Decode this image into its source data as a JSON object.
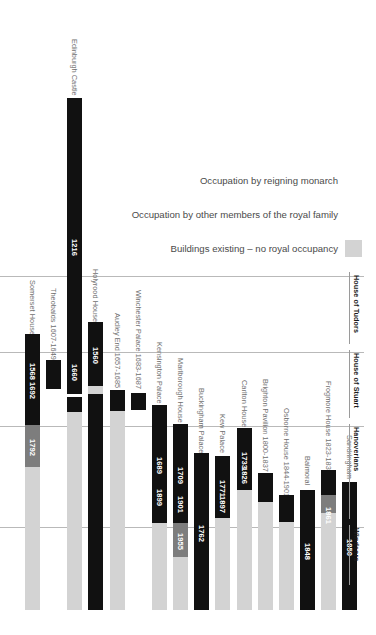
{
  "chart_data": {
    "type": "bar",
    "title": "",
    "orientation": "vertical-timeline",
    "xlabel": "",
    "ylabel": "",
    "legend_position": "top-right",
    "grid": true,
    "colors": {
      "monarch": "#111111",
      "family": "#7d7d7d",
      "none": "#d3d3d3"
    },
    "legend": [
      {
        "label": "Occupation by reigning monarch",
        "key": "monarch",
        "color": "#111111"
      },
      {
        "label": "Occupation by other members of the royal family",
        "key": "family",
        "color": "#7d7d7d"
      },
      {
        "label": "Buildings existing – no royal occupancy",
        "key": "none",
        "color": "#d3d3d3"
      }
    ],
    "eras": [
      {
        "label": "House of Tudors",
        "top": 272
      },
      {
        "label": "House of Stuart",
        "top": 350
      },
      {
        "label": "Hanoverians",
        "top": 424
      },
      {
        "label": "Windsors",
        "top": 525
      }
    ],
    "gridlines": [
      276,
      352,
      426,
      527
    ],
    "categories": [
      "Somerset House",
      "Theobalds 1607-1649",
      "Edinburgh Castle",
      "Holyrood House",
      "Audley End 1657-1685",
      "Winchester Palace 1683-1687",
      "Kensington Palace",
      "Marlborough House",
      "Buckingham Palace",
      "Kew Palace",
      "Carlton House",
      "Brighton Pavilion 1800-1837",
      "Osborne House 1844-1901",
      "Balmoral",
      "Frogmore House 1823-1837",
      "Sandringham"
    ],
    "bars": [
      {
        "name": "Somerset House",
        "label": "Somerset House",
        "x": 25,
        "label_top": 282,
        "label_height": 52,
        "segments": [
          {
            "kind": "monarch",
            "top": 334,
            "height": 91,
            "year": "1568 1692"
          },
          {
            "kind": "family",
            "top": 425,
            "height": 42,
            "year": "1792"
          },
          {
            "kind": "none",
            "top": 467,
            "height": 143,
            "year": ""
          }
        ]
      },
      {
        "name": "Theobalds",
        "label": "Theobalds 1607-1649",
        "x": 46,
        "label_top": 287,
        "label_height": 73,
        "segments": [
          {
            "kind": "monarch",
            "top": 360,
            "height": 29,
            "year": ""
          }
        ]
      },
      {
        "name": "Edinburgh Castle",
        "label": "Edinburgh Castle",
        "x": 67,
        "label_top": 36,
        "label_height": 62,
        "segments": [
          {
            "kind": "monarch",
            "top": 98,
            "height": 296,
            "year": "1216"
          },
          {
            "kind": "monarch",
            "top": 397,
            "height": 15,
            "year": ""
          },
          {
            "kind": "none",
            "top": 412,
            "height": 198,
            "year": ""
          }
        ],
        "extra_year": {
          "text": "1660",
          "top": 355
        }
      },
      {
        "name": "Holyrood House",
        "label": "Holyrood House",
        "x": 88,
        "label_top": 268,
        "label_height": 54,
        "segments": [
          {
            "kind": "monarch",
            "top": 322,
            "height": 64,
            "year": "1560"
          },
          {
            "kind": "none",
            "top": 386,
            "height": 8,
            "year": ""
          },
          {
            "kind": "monarch",
            "top": 394,
            "height": 216,
            "year": ""
          }
        ]
      },
      {
        "name": "Audley End",
        "label": "Audley End 1657-1685",
        "x": 110,
        "label_top": 312,
        "label_height": 78,
        "segments": [
          {
            "kind": "monarch",
            "top": 390,
            "height": 21,
            "year": ""
          },
          {
            "kind": "none",
            "top": 411,
            "height": 199,
            "year": ""
          }
        ]
      },
      {
        "name": "Winchester Palace",
        "label": "Winchester Palace 1683-1687",
        "x": 131,
        "label_top": 290,
        "label_height": 100,
        "segments": [
          {
            "kind": "monarch",
            "top": 393,
            "height": 17,
            "year": ""
          }
        ]
      },
      {
        "name": "Kensington Palace",
        "label": "Kensington Palace",
        "x": 152,
        "label_top": 340,
        "label_height": 65,
        "segments": [
          {
            "kind": "monarch",
            "top": 405,
            "height": 118,
            "year": "1689"
          },
          {
            "kind": "none",
            "top": 523,
            "height": 87,
            "year": ""
          }
        ],
        "extra_year": {
          "text": "1899",
          "top": 480
        }
      },
      {
        "name": "Marlborough House",
        "label": "Marlborough House",
        "x": 173,
        "label_top": 356,
        "label_height": 68,
        "segments": [
          {
            "kind": "monarch",
            "top": 424,
            "height": 99,
            "year": "1709"
          },
          {
            "kind": "family",
            "top": 523,
            "height": 34,
            "year": "1955"
          },
          {
            "kind": "none",
            "top": 557,
            "height": 53,
            "year": ""
          }
        ],
        "extra_year": {
          "text": "1901",
          "top": 487
        }
      },
      {
        "name": "Buckingham Palace",
        "label": "Buckingham Palace",
        "x": 194,
        "label_top": 388,
        "label_height": 65,
        "segments": [
          {
            "kind": "monarch",
            "top": 453,
            "height": 157,
            "year": "1762"
          }
        ]
      },
      {
        "name": "Kew Palace",
        "label": "Kew Palace",
        "x": 215,
        "label_top": 411,
        "label_height": 45,
        "segments": [
          {
            "kind": "monarch",
            "top": 456,
            "height": 62,
            "year": "1771"
          },
          {
            "kind": "none",
            "top": 518,
            "height": 92,
            "year": ""
          }
        ],
        "extra_year": {
          "text": "1897",
          "top": 487
        }
      },
      {
        "name": "Carlton House",
        "label": "Carlton House",
        "x": 237,
        "label_top": 380,
        "label_height": 48,
        "segments": [
          {
            "kind": "monarch",
            "top": 428,
            "height": 62,
            "year": "1733"
          },
          {
            "kind": "none",
            "top": 490,
            "height": 120,
            "year": ""
          }
        ],
        "extra_year": {
          "text": "1826",
          "top": 458
        }
      },
      {
        "name": "Brighton Pavilion",
        "label": "Brighton Pavilion 1800-1837",
        "x": 258,
        "label_top": 378,
        "label_height": 95,
        "segments": [
          {
            "kind": "monarch",
            "top": 473,
            "height": 29,
            "year": ""
          },
          {
            "kind": "none",
            "top": 502,
            "height": 108,
            "year": ""
          }
        ]
      },
      {
        "name": "Osborne House",
        "label": "Osborne House 1844-1901",
        "x": 279,
        "label_top": 410,
        "label_height": 85,
        "segments": [
          {
            "kind": "monarch",
            "top": 495,
            "height": 27,
            "year": ""
          },
          {
            "kind": "none",
            "top": 522,
            "height": 88,
            "year": ""
          }
        ]
      },
      {
        "name": "Balmoral",
        "label": "Balmoral",
        "x": 300,
        "label_top": 452,
        "label_height": 38,
        "segments": [
          {
            "kind": "monarch",
            "top": 490,
            "height": 120,
            "year": "1848"
          }
        ]
      },
      {
        "name": "Frogmore House",
        "label": "Frogmore House 1823-1837",
        "x": 321,
        "label_top": 385,
        "label_height": 85,
        "segments": [
          {
            "kind": "monarch",
            "top": 470,
            "height": 25,
            "year": ""
          },
          {
            "kind": "family",
            "top": 495,
            "height": 18,
            "year": ""
          },
          {
            "kind": "none",
            "top": 513,
            "height": 97,
            "year": ""
          }
        ],
        "extra_year": {
          "text": "1861",
          "top": 498,
          "on_light": true
        }
      },
      {
        "name": "Sandringham",
        "label": "Sandringham",
        "x": 342,
        "label_top": 432,
        "label_height": 50,
        "segments": [
          {
            "kind": "monarch",
            "top": 482,
            "height": 128,
            "year": "1850"
          }
        ]
      }
    ]
  }
}
